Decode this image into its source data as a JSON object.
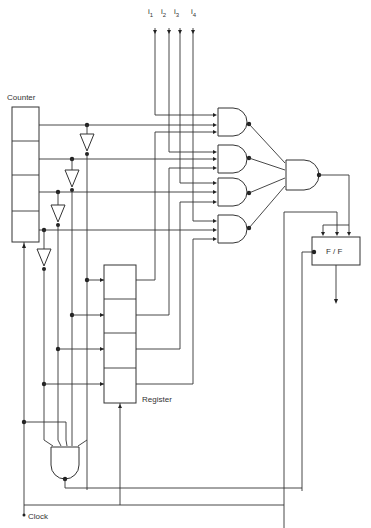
{
  "diagram": {
    "type": "logic-circuit",
    "inputs": [
      {
        "name": "i",
        "sub": "1"
      },
      {
        "name": "i",
        "sub": "2"
      },
      {
        "name": "i",
        "sub": "3"
      },
      {
        "name": "i",
        "sub": "4"
      }
    ],
    "labels": {
      "counter": "Counter",
      "register": "Register",
      "flipflop": "F / F",
      "clock": "Clock"
    },
    "components": {
      "counter_cells": 4,
      "register_cells": 4,
      "inverters": 4,
      "input_and_gates": 4,
      "combining_gate": 1,
      "compare_gate": 1
    },
    "colors": {
      "line": "#333333",
      "background": "#ffffff"
    }
  }
}
